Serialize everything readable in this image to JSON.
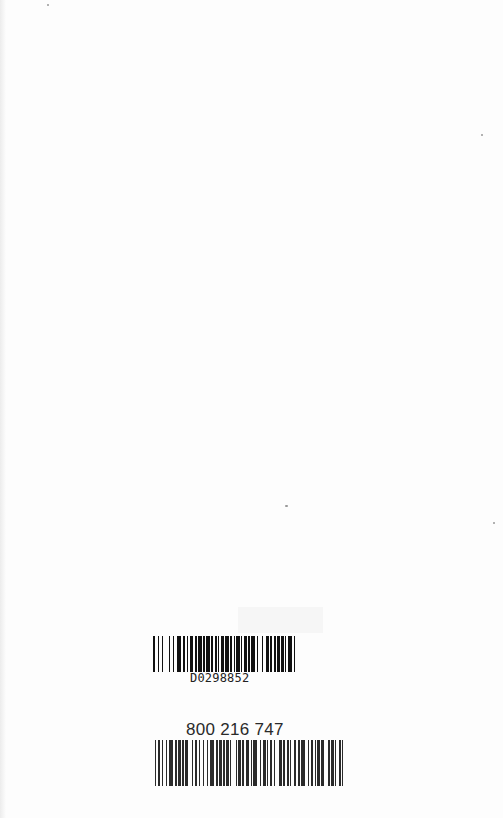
{
  "page": {
    "background": "#fdfdfd"
  },
  "barcodes": [
    {
      "id": "library",
      "label": "D0298852",
      "pattern": [
        2,
        2,
        1,
        3,
        1,
        5,
        1,
        2,
        1,
        3,
        3,
        2,
        2,
        1,
        1,
        2,
        3,
        1,
        2,
        1,
        3,
        1,
        2,
        1,
        3,
        1,
        2,
        2,
        1,
        1,
        1,
        2,
        2,
        1,
        4,
        1,
        1,
        2,
        1,
        1,
        3,
        1,
        1,
        2,
        2,
        1,
        2,
        1,
        3,
        2,
        1,
        3,
        1,
        3,
        2,
        1,
        2,
        2,
        1,
        1,
        3,
        1,
        2,
        1,
        1,
        2,
        3,
        2,
        1,
        3
      ]
    },
    {
      "id": "isbn",
      "label": "800 216 747",
      "pattern": [
        1,
        1,
        2,
        1,
        1,
        2,
        1,
        1,
        3,
        2,
        1,
        1,
        2,
        1,
        1,
        1,
        2,
        3,
        1,
        1,
        2,
        1,
        1,
        2,
        1,
        2,
        1,
        1,
        3,
        2,
        1,
        1,
        2,
        1,
        1,
        1,
        2,
        1,
        1,
        3,
        1,
        1,
        2,
        1,
        1,
        2,
        2,
        1,
        1,
        1,
        3,
        2,
        1,
        1,
        2,
        1,
        1,
        1,
        2,
        1,
        1,
        3,
        2,
        1,
        1,
        2,
        1,
        1,
        1,
        2,
        1,
        2,
        1,
        1,
        3,
        2,
        1,
        1,
        2,
        1,
        1,
        1,
        2,
        1,
        2,
        3,
        1,
        1,
        2,
        1,
        1,
        2,
        1,
        1,
        1,
        2
      ]
    }
  ]
}
